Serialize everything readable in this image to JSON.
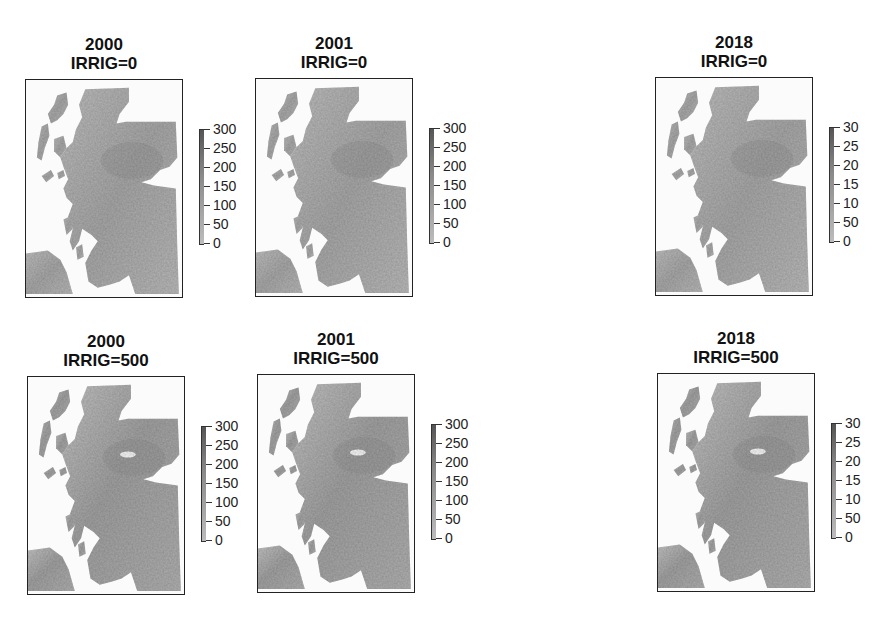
{
  "chart_data": {
    "type": "heatmap",
    "legend": {
      "ticks": [
        0,
        50,
        100,
        150,
        200,
        250,
        300
      ],
      "range": [
        0,
        300
      ],
      "placement": "right of each map"
    },
    "panels": [
      {
        "id": "2000-0",
        "year": "2000",
        "subtitle": "IRRIG=0",
        "row": 1,
        "col": 1,
        "legend_labels": [
          "300",
          "250",
          "200",
          "150",
          "100",
          "50",
          "0"
        ]
      },
      {
        "id": "2001-0",
        "year": "2001",
        "subtitle": "IRRIG=0",
        "row": 1,
        "col": 2,
        "legend_labels": [
          "300",
          "250",
          "200",
          "150",
          "100",
          "50",
          "0"
        ]
      },
      {
        "id": "2018-0",
        "year": "2018",
        "subtitle": "IRRIG=0",
        "row": 1,
        "col": 3,
        "legend_labels": [
          "30",
          "25",
          "20",
          "15",
          "10",
          "50",
          "0"
        ]
      },
      {
        "id": "2000-500",
        "year": "2000",
        "subtitle": "IRRIG=500",
        "row": 2,
        "col": 1,
        "legend_labels": [
          "300",
          "250",
          "200",
          "150",
          "100",
          "50",
          "0"
        ]
      },
      {
        "id": "2001-500",
        "year": "2001",
        "subtitle": "IRRIG=500",
        "row": 2,
        "col": 2,
        "legend_labels": [
          "300",
          "250",
          "200",
          "150",
          "100",
          "50",
          "0"
        ]
      },
      {
        "id": "2018-500",
        "year": "2018",
        "subtitle": "IRRIG=500",
        "row": 2,
        "col": 3,
        "legend_labels": [
          "30",
          "25",
          "20",
          "15",
          "10",
          "50",
          "0"
        ]
      }
    ],
    "colors": {
      "land_light": "#c4c4c4",
      "land_mid": "#a9a9a9",
      "land_dark": "#8f8f8f",
      "background": "#fbfbfb",
      "frame": "#222222"
    }
  }
}
